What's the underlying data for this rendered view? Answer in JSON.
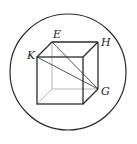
{
  "diagram": {
    "type": "cube-in-circle",
    "labels": {
      "E": "E",
      "H": "H",
      "K": "K",
      "G": "G"
    },
    "colors": {
      "stroke": "#2a2a2a",
      "hidden_stroke": "#9a9a9a",
      "background": "#ffffff"
    }
  }
}
